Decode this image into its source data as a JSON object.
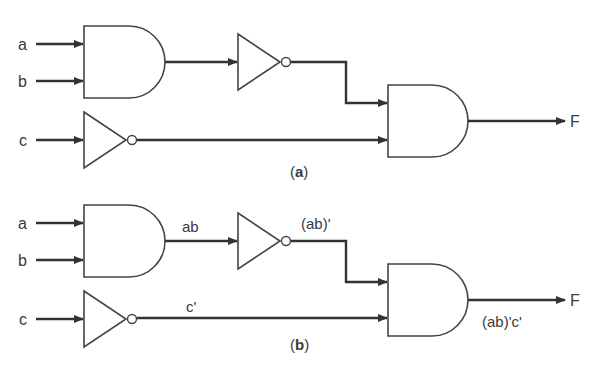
{
  "figure": {
    "panels": [
      {
        "id": "a",
        "caption_open": "(",
        "caption_letter": "a",
        "caption_close": ")",
        "inputs": [
          "a",
          "b",
          "c"
        ],
        "output": "F",
        "signal_labels": {}
      },
      {
        "id": "b",
        "caption_open": "(",
        "caption_letter": "b",
        "caption_close": ")",
        "inputs": [
          "a",
          "b",
          "c"
        ],
        "output": "F",
        "signal_labels": {
          "and1_out": "ab",
          "not1_out": "(ab)'",
          "notc_out": "c'",
          "and2_out": "(ab)'c'"
        }
      }
    ],
    "gates": [
      "AND",
      "NOT",
      "NOT",
      "AND"
    ],
    "colors": {
      "line": "#333333",
      "text": "#3a3a3a",
      "background": "#ffffff"
    }
  }
}
